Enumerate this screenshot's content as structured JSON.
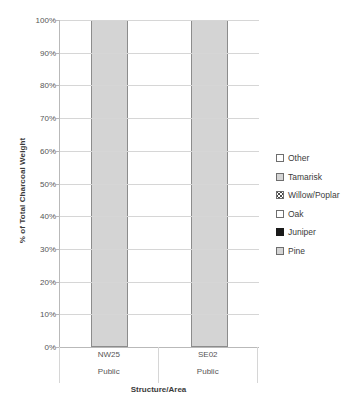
{
  "chart_data": {
    "type": "bar",
    "title": "",
    "subtitle": "",
    "xlabel": "Structure/Area",
    "ylabel": "% of Total Charcoal Weight",
    "categories": [
      "NW25",
      "SE02"
    ],
    "category_groups": [
      "Public",
      "Public"
    ],
    "ylim": [
      0,
      100
    ],
    "ytick_labels": [
      "0%",
      "10%",
      "20%",
      "30%",
      "40%",
      "50%",
      "60%",
      "70%",
      "80%",
      "90%",
      "100%"
    ],
    "ytick_values": [
      0,
      10,
      20,
      30,
      40,
      50,
      60,
      70,
      80,
      90,
      100
    ],
    "grid": true,
    "stacked": true,
    "legend_position": "right",
    "series": [
      {
        "name": "Other",
        "swatch": "empty",
        "values": [
          0,
          0
        ]
      },
      {
        "name": "Tamarisk",
        "swatch": "light",
        "values": [
          0,
          0
        ]
      },
      {
        "name": "Willow/Poplar",
        "swatch": "hatch",
        "values": [
          0,
          0
        ]
      },
      {
        "name": "Oak",
        "swatch": "empty",
        "values": [
          0,
          0
        ]
      },
      {
        "name": "Juniper",
        "swatch": "solid",
        "values": [
          0,
          0
        ]
      },
      {
        "name": "Pine",
        "swatch": "light",
        "values": [
          100,
          100
        ]
      }
    ],
    "bar_totals": [
      100,
      100
    ],
    "colors": {
      "bar_fill": "#d4d4d4",
      "bar_border": "#8c8c8c",
      "gridline": "#d6d6d6",
      "axis": "#b9b9b9",
      "text": "#3b3b3b",
      "tick_text": "#555555",
      "solid_swatch": "#1a1a1a"
    }
  }
}
